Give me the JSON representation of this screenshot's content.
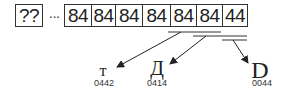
{
  "sequence": {
    "unknown_cell": "??",
    "ellipsis": "···",
    "cells": [
      "84",
      "84",
      "84",
      "84",
      "84",
      "84",
      "44"
    ]
  },
  "decoded": [
    {
      "glyph": "т",
      "code": "0442",
      "source_bytes": [
        "84",
        "84"
      ]
    },
    {
      "glyph": "Д",
      "code": "0414",
      "source_bytes": [
        "84",
        "84"
      ]
    },
    {
      "glyph": "D",
      "code": "0044",
      "source_bytes": [
        "44"
      ]
    }
  ]
}
